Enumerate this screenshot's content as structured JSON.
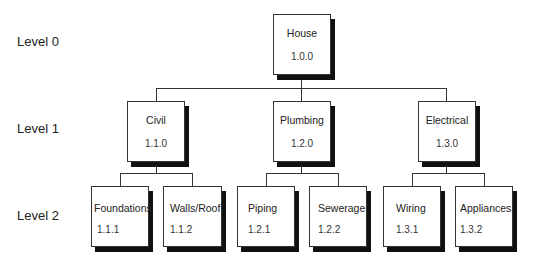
{
  "levels": [
    "Level 0",
    "Level 1",
    "Level 2"
  ],
  "root": {
    "name": "House",
    "code": "1.0.0"
  },
  "level1": [
    {
      "name": "Civil",
      "code": "1.1.0"
    },
    {
      "name": "Plumbing",
      "code": "1.2.0"
    },
    {
      "name": "Electrical",
      "code": "1.3.0"
    }
  ],
  "level2": [
    {
      "name": "Foundations",
      "code": "1.1.1"
    },
    {
      "name": "Walls/Roof",
      "code": "1.1.2"
    },
    {
      "name": "Piping",
      "code": "1.2.1"
    },
    {
      "name": "Sewerage",
      "code": "1.2.2"
    },
    {
      "name": "Wiring",
      "code": "1.3.1"
    },
    {
      "name": "Appliances",
      "code": "1.3.2"
    }
  ]
}
